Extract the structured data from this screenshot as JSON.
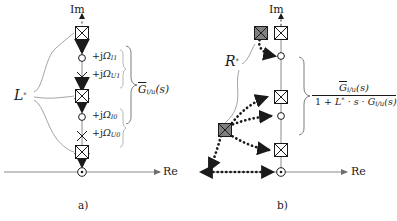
{
  "figure": {
    "type": "pole-zero-diagram",
    "panels": [
      {
        "id": "a",
        "caption": "a)",
        "axes": {
          "imaginary_label": "Im",
          "real_label": "Re"
        },
        "system_label": "L*",
        "system_label_base": "L",
        "system_label_star": "*",
        "bracket_label_base": "G",
        "bracket_label_sub": "i/u",
        "bracket_label_arg": "(s)",
        "frequency_labels": [
          {
            "text": "+jΩ",
            "prefix": "+j",
            "symbol": "Ω",
            "subscript": "I1"
          },
          {
            "text": "+jΩ",
            "prefix": "+j",
            "symbol": "Ω",
            "subscript": "U1"
          },
          {
            "text": "+jΩ",
            "prefix": "+j",
            "symbol": "Ω",
            "subscript": "I0"
          },
          {
            "text": "+jΩ",
            "prefix": "+j",
            "symbol": "Ω",
            "subscript": "U0"
          }
        ],
        "markers": [
          {
            "kind": "boxed-x",
            "fill": "white",
            "y": 33
          },
          {
            "kind": "circle",
            "fill": "white",
            "y": 58
          },
          {
            "kind": "x",
            "fill": "none",
            "y": 77
          },
          {
            "kind": "boxed-x",
            "fill": "white",
            "y": 96
          },
          {
            "kind": "circle",
            "fill": "white",
            "y": 117
          },
          {
            "kind": "x",
            "fill": "none",
            "y": 136
          },
          {
            "kind": "boxed-x",
            "fill": "white",
            "y": 152
          },
          {
            "kind": "circle-dot",
            "fill": "white",
            "y": 172
          }
        ],
        "leader_count": 3
      },
      {
        "id": "b",
        "caption": "b)",
        "axes": {
          "imaginary_label": "Im",
          "real_label": "Re"
        },
        "system_label": "R*",
        "system_label_base": "R",
        "system_label_star": "*",
        "transfer_numerator_base": "G",
        "transfer_numerator_sub": "i/u",
        "transfer_numerator_arg": "(s)",
        "transfer_denominator": "1 + L* · s · G i/u (s)",
        "markers": [
          {
            "kind": "boxed-x",
            "fill": "white",
            "y": 33
          },
          {
            "kind": "circle",
            "fill": "white",
            "y": 52
          },
          {
            "kind": "boxed-x",
            "fill": "white",
            "y": 96
          },
          {
            "kind": "circle",
            "fill": "white",
            "y": 117
          },
          {
            "kind": "boxed-x",
            "fill": "white",
            "y": 147
          },
          {
            "kind": "circle-dot",
            "fill": "white",
            "y": 172
          }
        ],
        "shifted_markers": [
          {
            "kind": "boxed-x",
            "fill": "#808080",
            "x": 56,
            "y": 33
          },
          {
            "kind": "boxed-x",
            "fill": "#808080",
            "x": 22,
            "y": 127
          }
        ],
        "leader_count": 2
      }
    ],
    "colors": {
      "axis": "#8c8c8c",
      "marker_stroke": "#1a1a1a",
      "shifted_fill": "#808080",
      "arrow": "#1a1a1a",
      "leader": "#8c8c8c",
      "text": "#1a1a1a"
    }
  }
}
